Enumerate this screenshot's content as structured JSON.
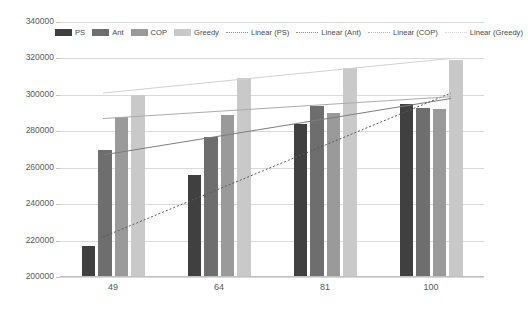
{
  "chart_data": {
    "type": "bar",
    "title": "",
    "xlabel": "",
    "ylabel": "",
    "categories": [
      "49",
      "64",
      "81",
      "100"
    ],
    "ylim": [
      200000,
      340000
    ],
    "ytick_step": 20000,
    "yticks": [
      "200000",
      "220000",
      "240000",
      "260000",
      "280000",
      "300000",
      "320000",
      "340000"
    ],
    "grid": true,
    "legend_position": "top-inside",
    "series": [
      {
        "name": "PS",
        "values": [
          217000,
          256000,
          284000,
          295000
        ],
        "color": "#404040"
      },
      {
        "name": "Ant",
        "values": [
          270000,
          277000,
          294000,
          293000
        ],
        "color": "#6e6e6e"
      },
      {
        "name": "COP",
        "values": [
          288000,
          289000,
          290000,
          292000
        ],
        "color": "#9a9a9a"
      },
      {
        "name": "Greedy",
        "values": [
          300000,
          309000,
          315000,
          319000
        ],
        "color": "#c9c9c9"
      }
    ],
    "trendlines": [
      {
        "name": "Linear (PS)",
        "start": 222000,
        "end": 301000,
        "color": "#5a5a5a",
        "style": "dotted"
      },
      {
        "name": "Linear (Ant)",
        "start": 267000,
        "end": 298000,
        "color": "#7d7d7d",
        "style": "solid"
      },
      {
        "name": "Linear (COP)",
        "start": 287000,
        "end": 299000,
        "color": "#ababab",
        "style": "solid"
      },
      {
        "name": "Linear (Greedy)",
        "start": 301000,
        "end": 320000,
        "color": "#d2d2d2",
        "style": "solid"
      }
    ]
  },
  "legend": {
    "items": [
      {
        "label": "PS",
        "kind": "swatch",
        "color": "#404040"
      },
      {
        "label": "Ant",
        "kind": "swatch",
        "color": "#6e6e6e"
      },
      {
        "label": "COP",
        "kind": "swatch",
        "color": "#9a9a9a"
      },
      {
        "label": "Greedy",
        "kind": "swatch",
        "color": "#c9c9c9"
      },
      {
        "label": "Linear (PS)",
        "kind": "dash",
        "color": "#8d8d8d"
      },
      {
        "label": "Linear (Ant)",
        "kind": "dash",
        "color": "#8d8d8d"
      },
      {
        "label": "Linear (COP)",
        "kind": "dash",
        "color": "#b5b5b5"
      },
      {
        "label": "Linear (Greedy)",
        "kind": "dash",
        "color": "#d8d8d8"
      }
    ]
  },
  "colors": {
    "gridline": "#d9d9d9",
    "axis_text": "#595959",
    "background": "#ffffff"
  }
}
